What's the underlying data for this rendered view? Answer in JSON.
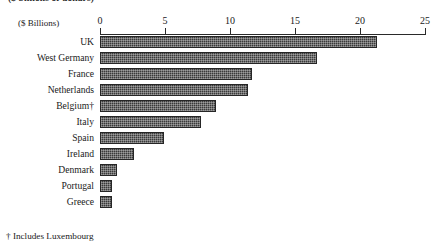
{
  "figure": {
    "title_clipped": "($ billions of dollars)",
    "units_label": "($ Billions)",
    "footnote": "† Includes Luxembourg"
  },
  "chart_data": {
    "type": "bar",
    "orientation": "horizontal",
    "title": "",
    "xlabel": "($ Billions)",
    "ylabel": "",
    "xlim": [
      0,
      25
    ],
    "grid": false,
    "legend": "none",
    "bar_color": "#3a3a3a",
    "ticks": [
      0,
      5,
      10,
      15,
      20,
      25
    ],
    "tick_labels": [
      "0",
      "5",
      "10",
      "15",
      "20",
      "25"
    ],
    "categories": [
      "UK",
      "West Germany",
      "France",
      "Netherlands",
      "Belgium†",
      "Italy",
      "Spain",
      "Ireland",
      "Denmark",
      "Portugal",
      "Greece"
    ],
    "values": [
      21.3,
      16.7,
      11.7,
      11.4,
      8.9,
      7.8,
      4.9,
      2.6,
      1.3,
      0.9,
      0.9
    ],
    "annotations": [
      "† Includes Luxembourg"
    ]
  }
}
